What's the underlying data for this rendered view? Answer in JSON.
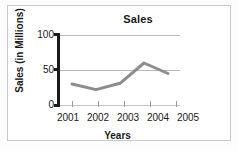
{
  "chart_data": {
    "type": "line",
    "title": "Sales",
    "xlabel": "Years",
    "ylabel": "Sales (in Millions)",
    "categories": [
      "2001",
      "2002",
      "2003",
      "2004",
      "2005"
    ],
    "values": [
      30,
      22,
      31,
      60,
      45
    ],
    "series": [
      {
        "name": "Sales",
        "values": [
          30,
          22,
          31,
          60,
          45
        ],
        "color": "#8d8d8d"
      }
    ],
    "ylim": [
      0,
      100
    ],
    "yticks": [
      0,
      50,
      100
    ],
    "ytick_labels": [
      "0",
      "50",
      "100"
    ],
    "grid": true,
    "legend": "none",
    "line_color": "#8d8d8d",
    "axis_color": "#1a1a1a",
    "grid_color": "#b8b8b8"
  }
}
